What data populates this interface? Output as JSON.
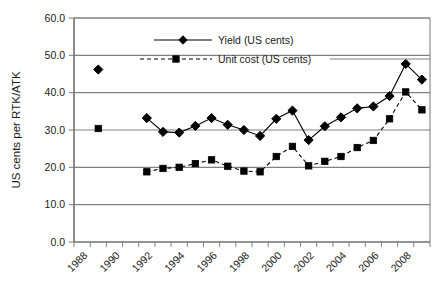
{
  "chart_data": {
    "type": "line",
    "title": "",
    "xlabel": "",
    "ylabel": "US cents per RTK/ATK",
    "ylim": [
      0.0,
      60.0
    ],
    "ytick_labels": [
      "0.0",
      "10.0",
      "20.0",
      "30.0",
      "40.0",
      "50.0",
      "60.0"
    ],
    "ytick_values": [
      0,
      10,
      20,
      30,
      40,
      50,
      60
    ],
    "grid": "horizontal",
    "legend_position": "upper-center",
    "categories": [
      1988,
      1989,
      1990,
      1991,
      1992,
      1993,
      1994,
      1995,
      1996,
      1997,
      1998,
      1999,
      2000,
      2001,
      2002,
      2003,
      2004,
      2005,
      2006,
      2007,
      2008,
      2009
    ],
    "xtick_labels": [
      "1988",
      "1990",
      "1992",
      "1994",
      "1996",
      "1998",
      "2000",
      "2002",
      "2004",
      "2006",
      "2008"
    ],
    "xtick_values": [
      1988,
      1990,
      1992,
      1994,
      1996,
      1998,
      2000,
      2002,
      2004,
      2006,
      2008
    ],
    "series": [
      {
        "name": "Yield (US cents)",
        "marker": "diamond",
        "line": "solid",
        "color": "#000000",
        "x": [
          1989,
          1992,
          1993,
          1994,
          1995,
          1996,
          1997,
          1998,
          1999,
          2000,
          2001,
          2002,
          2003,
          2004,
          2005,
          2006,
          2007,
          2008,
          2009
        ],
        "values": [
          46.2,
          33.2,
          29.5,
          29.3,
          31.1,
          33.2,
          31.4,
          30.0,
          28.4,
          33.0,
          35.2,
          27.3,
          31.0,
          33.4,
          35.8,
          36.3,
          39.1,
          47.7,
          43.5
        ]
      },
      {
        "name": "Unit cost (US cents)",
        "marker": "square",
        "line": "dashed",
        "color": "#000000",
        "x": [
          1989,
          1992,
          1993,
          1994,
          1995,
          1996,
          1997,
          1998,
          1999,
          2000,
          2001,
          2002,
          2003,
          2004,
          2005,
          2006,
          2007,
          2008,
          2009
        ],
        "values": [
          30.4,
          18.8,
          19.7,
          20.0,
          21.0,
          22.0,
          20.3,
          19.0,
          18.8,
          22.9,
          25.6,
          20.4,
          21.6,
          22.9,
          25.3,
          27.2,
          33.0,
          40.2,
          35.4
        ]
      }
    ]
  },
  "legend": {
    "items": [
      {
        "label": "Yield (US cents)"
      },
      {
        "label": "Unit cost (US cents)"
      }
    ]
  },
  "axes": {
    "y_title": "US cents per RTK/ATK"
  },
  "colors": {
    "plot_border": "#808080",
    "gridline": "#808080",
    "series": "#000000",
    "background": "#ffffff"
  }
}
